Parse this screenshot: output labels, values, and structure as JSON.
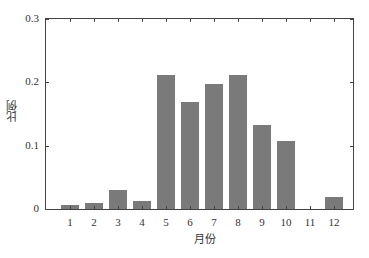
{
  "chart_data": {
    "type": "bar",
    "title": "",
    "xlabel": "月份",
    "ylabel": "比例",
    "categories": [
      "1",
      "2",
      "3",
      "4",
      "5",
      "6",
      "7",
      "8",
      "9",
      "10",
      "11",
      "12"
    ],
    "values": [
      0.006,
      0.009,
      0.03,
      0.012,
      0.211,
      0.169,
      0.198,
      0.212,
      0.133,
      0.108,
      0.0,
      0.019
    ],
    "ylim": [
      0,
      0.3
    ],
    "yticks": [
      "0",
      "0.1",
      "0.2",
      "0.3"
    ],
    "grid": false,
    "legend": null,
    "bar_color": "#7a7a7a"
  }
}
